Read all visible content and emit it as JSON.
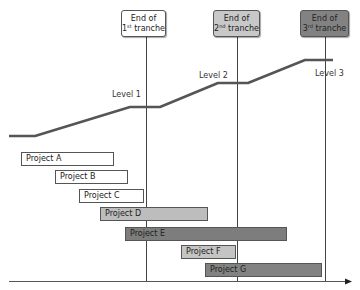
{
  "tranches": [
    {
      "line1": "End of",
      "ord": "1",
      "suffix": "st",
      "word": "tranche",
      "fill": "#ffffff",
      "x": 121,
      "w": 45,
      "line_x": 146
    },
    {
      "line1": "End of",
      "ord": "2",
      "suffix": "nd",
      "word": "tranche",
      "fill": "#c8c8c8",
      "x": 213,
      "w": 47,
      "line_x": 237
    },
    {
      "line1": "End of",
      "ord": "3",
      "suffix": "rd",
      "word": "tranche",
      "fill": "#828282",
      "x": 300,
      "w": 49,
      "line_x": 325
    }
  ],
  "levels": [
    {
      "label": "Level 1",
      "x": 112,
      "y": 90
    },
    {
      "label": "Level 2",
      "x": 199,
      "y": 71
    },
    {
      "label": "Level 3",
      "x": 315,
      "y": 69
    }
  ],
  "level_line_points": [
    [
      9,
      136
    ],
    [
      35,
      136
    ],
    [
      130,
      107
    ],
    [
      160,
      107
    ],
    [
      218,
      83
    ],
    [
      248,
      83
    ],
    [
      305,
      60
    ],
    [
      333,
      60
    ]
  ],
  "projects": [
    {
      "label": "Project A",
      "x": 21,
      "y": 152,
      "w": 93,
      "fill": "#ffffff"
    },
    {
      "label": "Project B",
      "x": 55,
      "y": 170,
      "w": 73,
      "fill": "#ffffff"
    },
    {
      "label": "Project C",
      "x": 79,
      "y": 189,
      "w": 65,
      "fill": "#ffffff"
    },
    {
      "label": "Project D",
      "x": 100,
      "y": 207,
      "w": 108,
      "fill": "#bdbdbd"
    },
    {
      "label": "Project E",
      "x": 125,
      "y": 227,
      "w": 162,
      "fill": "#7d7d7d"
    },
    {
      "label": "Project F",
      "x": 181,
      "y": 245,
      "w": 55,
      "fill": "#c4c4c4"
    },
    {
      "label": "Project G",
      "x": 205,
      "y": 263,
      "w": 117,
      "fill": "#828282"
    }
  ],
  "axis": {
    "x1": 9,
    "x2": 352,
    "y": 281
  }
}
